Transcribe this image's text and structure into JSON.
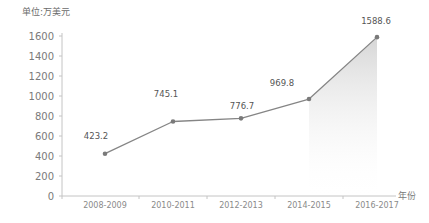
{
  "chart_data": {
    "type": "line",
    "title": "",
    "subtitle": "",
    "unit_note": "单位:万美元",
    "xlabel": "年份",
    "ylabel": "",
    "categories": [
      "2008-2009",
      "2010-2011",
      "2012-2013",
      "2014-2015",
      "2016-2017"
    ],
    "values": [
      423.2,
      745.1,
      776.7,
      969.8,
      1588.6
    ],
    "value_labels": [
      "423.2",
      "745.1",
      "776.7",
      "969.8",
      "1588.6"
    ],
    "series": [
      {
        "name": "",
        "values": [
          423.2,
          745.1,
          776.7,
          969.8,
          1588.6
        ]
      }
    ],
    "ylim": [
      0,
      1600
    ],
    "yticks": [
      0,
      200,
      400,
      600,
      800,
      1000,
      1200,
      1400,
      1600
    ],
    "ytick_labels": [
      "0",
      "200",
      "400",
      "600",
      "800",
      "1000",
      "1200",
      "1400",
      "1600"
    ],
    "grid": false,
    "legend": false,
    "legend_position": "none",
    "marker": "circle",
    "area_fill": true,
    "colors": {
      "line": "#808080",
      "marker": "#7a7a7a",
      "axis": "#bdbdbd",
      "tick_text": "#7a7a7a",
      "value_text": "#555555",
      "area_fill_top": "#d8d8d8",
      "area_fill_bottom": "#ffffff"
    }
  }
}
